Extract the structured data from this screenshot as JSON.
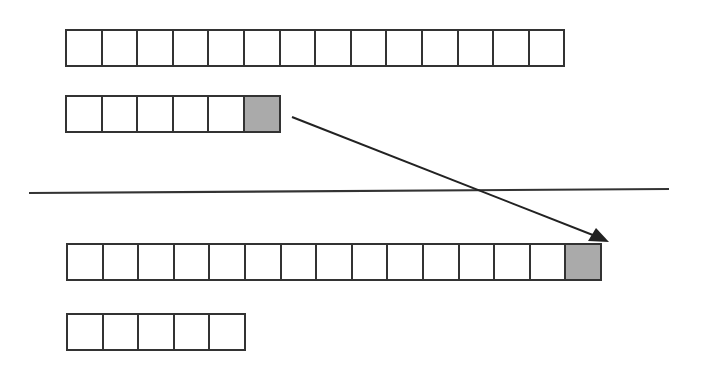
{
  "diagram": {
    "colors": {
      "stroke": "#333333",
      "filled_cell": "#aaaaaa",
      "empty_cell": "#ffffff"
    },
    "above_divider": {
      "rows": [
        {
          "id": "top-long-row",
          "cells": 14,
          "filled_indices": []
        },
        {
          "id": "top-short-row",
          "cells": 6,
          "filled_indices": [
            5
          ]
        }
      ]
    },
    "divider": {
      "orientation": "horizontal"
    },
    "below_divider": {
      "rows": [
        {
          "id": "bottom-long-row",
          "cells": 15,
          "filled_indices": [
            14
          ]
        },
        {
          "id": "bottom-short-row",
          "cells": 5,
          "filled_indices": []
        }
      ]
    },
    "arrow": {
      "from": "top-short-row.cell-5",
      "to": "bottom-long-row.cell-14"
    }
  }
}
